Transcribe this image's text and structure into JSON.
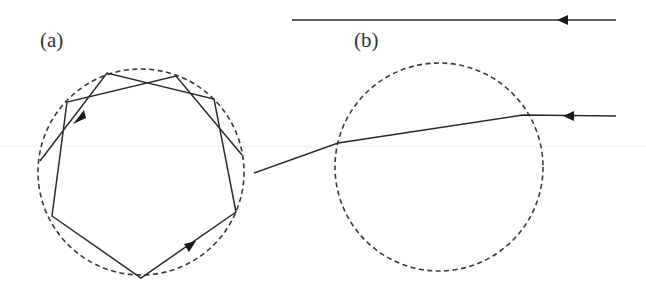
{
  "panels": {
    "a": {
      "label": "(a)",
      "description": "Ray trapped inside circle by repeated total internal reflection forming a star-like polygonal path",
      "circle": {
        "cx": 141,
        "cy": 172,
        "r": 103,
        "style": "dashed"
      },
      "path_points": [
        [
          40,
          161
        ],
        [
          107,
          73
        ],
        [
          214,
          99
        ],
        [
          236,
          212
        ],
        [
          141,
          278
        ],
        [
          52,
          216
        ],
        [
          67,
          102
        ],
        [
          176,
          76
        ],
        [
          242,
          155
        ]
      ],
      "arrows": [
        {
          "x": 78,
          "y": 116,
          "angle": 127
        },
        {
          "x": 190,
          "y": 245,
          "angle": -33
        }
      ]
    },
    "b": {
      "label": "(b)",
      "description": "Ray refracting through a circle; an undeflected reference ray passes above",
      "circle": {
        "cx": 439,
        "cy": 167,
        "r": 104,
        "style": "dashed"
      },
      "reference_ray": {
        "x1": 292,
        "y1": 20,
        "x2": 616,
        "y2": 20,
        "arrow_x": 562
      },
      "refracted_ray": [
        [
          616,
          116
        ],
        [
          523,
          116
        ],
        [
          338,
          143
        ],
        [
          254,
          173
        ]
      ],
      "arrow_on_refracted": {
        "x": 569,
        "y": 116
      }
    }
  },
  "colors": {
    "line": "#2a2a2a",
    "dashed": "#3a3a3a",
    "background": "#ffffff"
  }
}
